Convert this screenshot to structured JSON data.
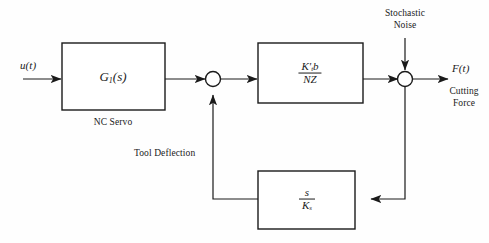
{
  "diagram": {
    "type": "control-system-block-diagram",
    "background_color": "#fefefe",
    "line_color": "#1a1a1a",
    "text_color": "#1a1a1a",
    "input": {
      "label": "u(t)"
    },
    "output": {
      "label": "F(t)",
      "caption_line1": "Cutting",
      "caption_line2": "Force"
    },
    "disturbance": {
      "caption_line1": "Stochastic",
      "caption_line2": "Noise"
    },
    "feedback_signal": {
      "label": "Tool Deflection"
    },
    "blocks": [
      {
        "id": "nc-servo",
        "expression_main": "G",
        "expression_sub": "1",
        "expression_tail": "(s)",
        "caption": "NC Servo"
      },
      {
        "id": "process-gain",
        "numerator_main": "K",
        "numerator_sub": "t",
        "numerator_prime": "'",
        "numerator_tail": "b",
        "denominator": "NZ"
      },
      {
        "id": "deflection-feedback",
        "numerator": "s",
        "denominator_main": "K",
        "denominator_sub": "s"
      }
    ],
    "junctions": [
      {
        "id": "sum-left",
        "sign": ""
      },
      {
        "id": "sum-right",
        "sign": ""
      }
    ]
  }
}
